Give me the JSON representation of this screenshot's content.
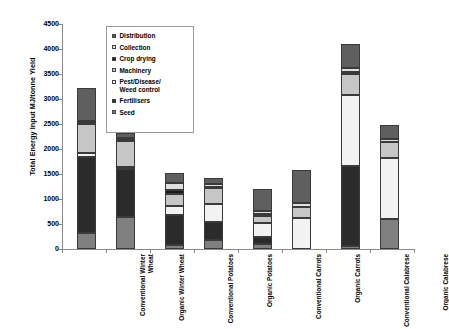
{
  "chart_data": {
    "type": "bar",
    "subtype": "stacked",
    "title": "",
    "xlabel": "",
    "ylabel": "Total Energy Input MJ/tonne Yield",
    "ylim": [
      0,
      4500
    ],
    "ytick_step": 500,
    "yticks": [
      "0",
      "500",
      "1000",
      "1500",
      "2000",
      "2500",
      "3000",
      "3500",
      "4000",
      "4500"
    ],
    "grid": false,
    "legend_position": "inside-top-left",
    "categories": [
      "Conventional Winter\nWheat",
      "Organic Winter Wheat",
      "Conventional Potatoes",
      "Organic Potatoes",
      "Conventional Carrots",
      "Organic Carrots",
      "Conventional Calabrese",
      "Organic Calabrese"
    ],
    "series": [
      {
        "name": "Seed",
        "color": "#808080",
        "values": [
          330,
          640,
          90,
          180,
          100,
          0,
          60,
          600
        ]
      },
      {
        "name": "Fertilisers",
        "color": "#2b2b2b",
        "values": [
          1510,
          960,
          600,
          360,
          150,
          0,
          1600,
          0
        ]
      },
      {
        "name": "Pest/Disease/\nWeed control",
        "color": "#f2f2f2",
        "values": [
          80,
          50,
          180,
          370,
          280,
          620,
          1420,
          1220
        ]
      },
      {
        "name": "Machinery",
        "color": "#c6c6c6",
        "values": [
          580,
          520,
          230,
          310,
          130,
          220,
          420,
          320
        ]
      },
      {
        "name": "Crop drying",
        "color": "#1c1c1c",
        "values": [
          30,
          30,
          90,
          20,
          40,
          0,
          50,
          0
        ]
      },
      {
        "name": "Collection",
        "color": "#e0e0e0",
        "values": [
          30,
          20,
          130,
          60,
          70,
          90,
          80,
          60
        ]
      },
      {
        "name": "Distribution",
        "color": "#5f5f5f",
        "values": [
          670,
          110,
          210,
          130,
          440,
          660,
          480,
          290
        ]
      }
    ],
    "totals": [
      3230,
      2330,
      1530,
      1430,
      1210,
      1590,
      4110,
      2490
    ],
    "legend_entries": [
      {
        "label": "Distribution",
        "color": "#5f5f5f"
      },
      {
        "label": "Collection",
        "color": "#e0e0e0"
      },
      {
        "label": "Crop drying",
        "color": "#1c1c1c"
      },
      {
        "label": "Machinery",
        "color": "#c6c6c6"
      },
      {
        "label": "Pest/Disease/\nWeed control",
        "color": "#f2f2f2"
      },
      {
        "label": "Fertilisers",
        "color": "#2b2b2b"
      },
      {
        "label": "Seed",
        "color": "#808080"
      }
    ]
  }
}
